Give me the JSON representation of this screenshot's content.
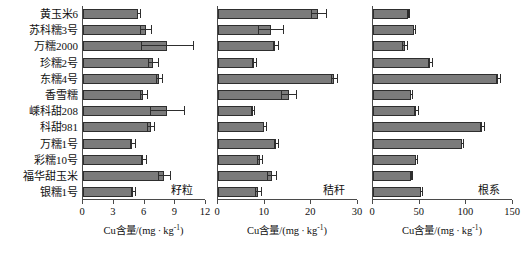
{
  "chart_data": {
    "type": "bar",
    "orientation": "horizontal",
    "title": "",
    "xlabel": "Cu含量/(mg·kg⁻¹)",
    "ylabel": "",
    "grid": false,
    "legend": "none",
    "categories": [
      "黄玉米6",
      "苏科糯3号",
      "万糯2000",
      "珍糯2号",
      "东糯4号",
      "香雪糯",
      "嵊科甜208",
      "科甜981",
      "万糯1号",
      "彩糯10号",
      "福华甜玉米",
      "银糯1号"
    ],
    "panels": [
      {
        "name": "籽粒",
        "xlim": [
          0,
          12
        ],
        "xticks": [
          0,
          3,
          6,
          9,
          12
        ],
        "xlabel": "Cu含量/(mg·kg⁻¹)",
        "values": [
          5.4,
          6.1,
          8.2,
          6.8,
          7.4,
          5.9,
          8.2,
          6.6,
          4.8,
          5.9,
          7.9,
          4.9
        ],
        "errors": [
          0.15,
          0.55,
          2.5,
          0.5,
          0.3,
          0.3,
          1.7,
          0.35,
          0.25,
          0.25,
          0.55,
          0.2
        ]
      },
      {
        "name": "秸秆",
        "xlim": [
          0,
          30
        ],
        "xticks": [
          0,
          10,
          20,
          30
        ],
        "xlabel": "Cu含量/(mg·kg⁻¹)",
        "values": [
          21.5,
          11.3,
          12.3,
          7.7,
          24.8,
          15.2,
          7.4,
          9.9,
          12.4,
          8.9,
          11.5,
          8.6
        ],
        "errors": [
          1.6,
          2.7,
          0.5,
          0.4,
          0.6,
          1.6,
          0.3,
          0.3,
          0.5,
          0.5,
          0.9,
          0.6
        ]
      },
      {
        "name": "根系",
        "xlim": [
          0,
          150
        ],
        "xticks": [
          0,
          50,
          100,
          150
        ],
        "xlabel": "Cu含量/(mg·kg⁻¹)",
        "values": [
          38,
          44,
          34,
          61,
          134,
          41,
          46,
          117,
          95,
          46,
          41,
          51
        ],
        "errors": [
          0.8,
          0.8,
          2.5,
          2.0,
          2.5,
          1.0,
          2.5,
          2.0,
          1.2,
          0.8,
          0.8,
          1.0
        ]
      }
    ],
    "colors": {
      "bar_fill": "#7b7b7b",
      "bar_edge": "#2e2e2e",
      "axis": "#4a4a4a",
      "background": "#ffffff"
    }
  }
}
